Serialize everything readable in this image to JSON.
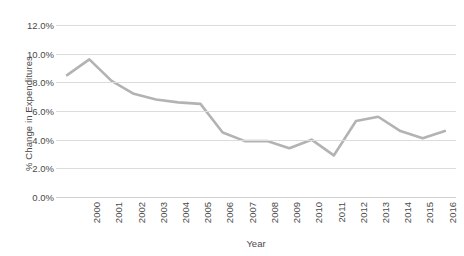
{
  "chart_data": {
    "type": "line",
    "title": "",
    "subtitle": "",
    "xlabel": "Year",
    "ylabel": "% Change in Expenditures",
    "categories": [
      "2000",
      "2001",
      "2002",
      "2003",
      "2004",
      "2005",
      "2006",
      "2007",
      "2008",
      "2009",
      "2010",
      "2011",
      "2012",
      "2013",
      "2014",
      "2015",
      "2016",
      "2017"
    ],
    "x": [
      2000,
      2001,
      2002,
      2003,
      2004,
      2005,
      2006,
      2007,
      2008,
      2009,
      2010,
      2011,
      2012,
      2013,
      2014,
      2015,
      2016,
      2017
    ],
    "values": [
      8.5,
      9.6,
      8.1,
      7.2,
      6.8,
      6.6,
      6.5,
      4.5,
      3.9,
      3.9,
      3.4,
      4.0,
      2.9,
      5.3,
      5.6,
      4.6,
      4.1,
      4.6
    ],
    "series": [
      {
        "name": "% Change in Expenditures",
        "values": [
          8.5,
          9.6,
          8.1,
          7.2,
          6.8,
          6.6,
          6.5,
          4.5,
          3.9,
          3.9,
          3.4,
          4.0,
          2.9,
          5.3,
          5.6,
          4.6,
          4.1,
          4.6
        ],
        "color": "#b3b3b3"
      }
    ],
    "ylim": [
      0,
      12
    ],
    "yticks": [
      0,
      2,
      4,
      6,
      8,
      10,
      12
    ],
    "ytick_labels": [
      "0.0%",
      "2.0%",
      "4.0%",
      "6.0%",
      "8.0%",
      "10.0%",
      "12.0%"
    ],
    "grid": true,
    "legend": false,
    "legend_position": "none",
    "annotations": []
  },
  "colors": {
    "line": "#b3b3b3",
    "gridline": "#dcdcdc",
    "text": "#4a4a4a",
    "background": "#ffffff"
  }
}
